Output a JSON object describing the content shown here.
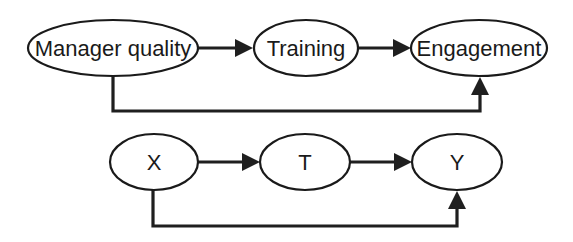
{
  "diagram": {
    "type": "causal-graph",
    "colors": {
      "stroke": "#1a1a1a",
      "fill": "#ffffff",
      "background": "#ffffff"
    },
    "top": {
      "nodes": [
        {
          "id": "manager",
          "label": "Manager quality"
        },
        {
          "id": "training",
          "label": "Training"
        },
        {
          "id": "engagement",
          "label": "Engagement"
        }
      ],
      "edges": [
        {
          "from": "manager",
          "to": "training"
        },
        {
          "from": "training",
          "to": "engagement"
        },
        {
          "from": "manager",
          "to": "engagement",
          "route": "below"
        }
      ]
    },
    "bottom": {
      "nodes": [
        {
          "id": "x",
          "label": "X"
        },
        {
          "id": "t",
          "label": "T"
        },
        {
          "id": "y",
          "label": "Y"
        }
      ],
      "edges": [
        {
          "from": "x",
          "to": "t"
        },
        {
          "from": "t",
          "to": "y"
        },
        {
          "from": "x",
          "to": "y",
          "route": "below"
        }
      ]
    }
  }
}
